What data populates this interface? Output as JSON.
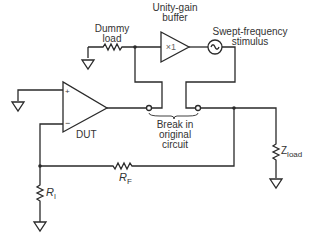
{
  "diagram": {
    "labels": {
      "dummy_load_line1": "Dummy",
      "dummy_load_line2": "load",
      "buffer_line1": "Unity-gain",
      "buffer_line2": "buffer",
      "buffer_gain": "×1",
      "stimulus_line1": "Swept-frequency",
      "stimulus_line2": "stimulus",
      "break_line1": "Break in",
      "break_line2": "original",
      "break_line3": "circuit",
      "dut": "DUT",
      "plus": "+",
      "minus": "−",
      "rf_main": "R",
      "rf_sub": "F",
      "ri_main": "R",
      "ri_sub": "I",
      "zload_main": "Z",
      "zload_sub": "load"
    },
    "colors": {
      "line": "#2a2a2a",
      "text": "#333333"
    }
  }
}
